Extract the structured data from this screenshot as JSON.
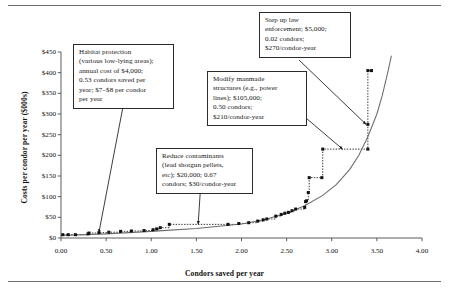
{
  "chart_data": {
    "type": "scatter",
    "title": "",
    "xlabel": "Condors saved per year",
    "ylabel": "Costs per condor per year ($000s)",
    "xlim": [
      0.0,
      4.0
    ],
    "ylim": [
      0,
      450
    ],
    "xticks": [
      "0.00",
      "0.50",
      "1.00",
      "1.50",
      "2.00",
      "2.50",
      "3.00",
      "3.50",
      "4.00"
    ],
    "xtick_values": [
      0.0,
      0.5,
      1.0,
      1.5,
      2.0,
      2.5,
      3.0,
      3.5,
      4.0
    ],
    "yticks": [
      "$0",
      "$50",
      "$100",
      "$150",
      "$200",
      "$250",
      "$300",
      "$350",
      "$400",
      "$450"
    ],
    "ytick_values": [
      0,
      50,
      100,
      150,
      200,
      250,
      300,
      350,
      400,
      450
    ],
    "grid": false,
    "legend": "none",
    "series": [
      {
        "name": "Marginal cost steps (conservation actions)",
        "marker": "square",
        "connector": "dotted-step",
        "points": [
          [
            0.02,
            8
          ],
          [
            0.08,
            8
          ],
          [
            0.16,
            8
          ],
          [
            0.3,
            10
          ],
          [
            0.31,
            12
          ],
          [
            0.42,
            13
          ],
          [
            0.53,
            14
          ],
          [
            0.66,
            16
          ],
          [
            0.78,
            17
          ],
          [
            0.92,
            18
          ],
          [
            1.02,
            20
          ],
          [
            1.06,
            22
          ],
          [
            1.1,
            25
          ],
          [
            1.2,
            33
          ],
          [
            1.85,
            33
          ],
          [
            1.97,
            35
          ],
          [
            2.08,
            37
          ],
          [
            2.18,
            41
          ],
          [
            2.24,
            44
          ],
          [
            2.28,
            46
          ],
          [
            2.38,
            53
          ],
          [
            2.44,
            57
          ],
          [
            2.48,
            60
          ],
          [
            2.52,
            62
          ],
          [
            2.56,
            66
          ],
          [
            2.6,
            70
          ],
          [
            2.7,
            74
          ],
          [
            2.71,
            88
          ],
          [
            2.72,
            90
          ],
          [
            2.74,
            110
          ],
          [
            2.75,
            146
          ],
          [
            2.89,
            146
          ],
          [
            2.9,
            215
          ],
          [
            3.4,
            215
          ],
          [
            3.4,
            275
          ],
          [
            3.4,
            405
          ],
          [
            3.44,
            405
          ]
        ]
      },
      {
        "name": "Fitted exponential cost curve",
        "marker": "none",
        "connector": "solid-curve",
        "points": [
          [
            0.0,
            6
          ],
          [
            0.5,
            10
          ],
          [
            1.0,
            16
          ],
          [
            1.5,
            23
          ],
          [
            2.0,
            34
          ],
          [
            2.25,
            44
          ],
          [
            2.5,
            60
          ],
          [
            2.7,
            78
          ],
          [
            2.9,
            103
          ],
          [
            3.05,
            129
          ],
          [
            3.2,
            166
          ],
          [
            3.3,
            200
          ],
          [
            3.4,
            245
          ],
          [
            3.5,
            300
          ],
          [
            3.56,
            345
          ],
          [
            3.62,
            400
          ],
          [
            3.66,
            440
          ]
        ]
      }
    ],
    "annotations": [
      {
        "id": "habitat-protection",
        "text": "Habitat protection (various low-lying areas); annual cost of $4,000; 0.53 condors saved per year; $7–8 per condor per year",
        "lines": [
          "Habitat protection",
          "(various low-lying areas);",
          "annual cost of $4,000;",
          "0.53 condors saved per",
          "year; $7–$8 per condor",
          "per year"
        ],
        "cost": "$4,000",
        "condors": "0.53",
        "unit_cost": "$7–$8 per condor-year",
        "points_to": [
          0.42,
          13
        ]
      },
      {
        "id": "reduce-contaminants",
        "text": "Reduce contaminants (lead shotgun pellets, etc); $20,000; 0.67 condors; $30/condor-year",
        "lines": [
          "Reduce contaminants",
          "(lead shotgun pellets,",
          "etc); $20,000; 0.67",
          "condors; $30/condor-year"
        ],
        "cost": "$20,000",
        "condors": "0.67",
        "unit_cost": "$30/condor-year",
        "points_to": [
          1.52,
          33
        ]
      },
      {
        "id": "modify-manmade-structures",
        "text": "Modify manmade structures (e.g., power lines); $105,000; 0.50 condors; $210/condor-year",
        "lines": [
          "Modify manmade",
          "structures (e.g., power",
          "lines); $105,000;",
          "0.50 condors;",
          "$210/condor-year"
        ],
        "cost": "$105,000",
        "condors": "0.50",
        "unit_cost": "$210/condor-year",
        "points_to": [
          3.12,
          215
        ]
      },
      {
        "id": "step-up-law-enforcement",
        "text": "Step up law enforcement; $5,000; 0.02 condors; $270/condor-year",
        "lines": [
          "Step up law",
          "enforcement; $5,000;",
          "0.02 condors;",
          "$270/condor-year"
        ],
        "cost": "$5,000",
        "condors": "0.02",
        "unit_cost": "$270/condor-year",
        "points_to": [
          3.38,
          275
        ]
      }
    ]
  },
  "axes": {
    "x_title": "Condors saved per year",
    "y_title": "Costs per condor per year ($000s)",
    "x_labels": [
      "0.00",
      "0.50",
      "1.00",
      "1.50",
      "2.00",
      "2.50",
      "3.00",
      "3.50",
      "4.00"
    ],
    "y_labels": [
      "$450",
      "$400",
      "$350",
      "$300",
      "$250",
      "$200",
      "$150",
      "$100",
      "$50",
      "$0"
    ]
  },
  "callouts": {
    "habitat": {
      "l1": "Habitat protection",
      "l2": "(various low-lying areas);",
      "l3": "annual cost of $4,000;",
      "l4": "0.53 condors saved per",
      "l5": "year; $7–$8 per condor",
      "l6": "per year"
    },
    "contaminants": {
      "l1": "Reduce contaminants",
      "l2": "(lead shotgun pellets,",
      "l3": "etc); $20,000; 0.67",
      "l4": "condors; $30/condor-year"
    },
    "manmade": {
      "l1": "Modify manmade",
      "l2": "structures (e.g., power",
      "l3": "lines); $105,000;",
      "l4": "0.50 condors;",
      "l5": "$210/condor-year"
    },
    "lawenforcement": {
      "l1": "Step up law",
      "l2": "enforcement; $5,000;",
      "l3": "0.02 condors;",
      "l4": "$270/condor-year"
    }
  },
  "colors": {
    "ink": "#1a1a1a",
    "axis": "#4a4a4a",
    "marker": "#111111",
    "curve": "#6b6b6b",
    "rule": "#6f6f6f"
  }
}
